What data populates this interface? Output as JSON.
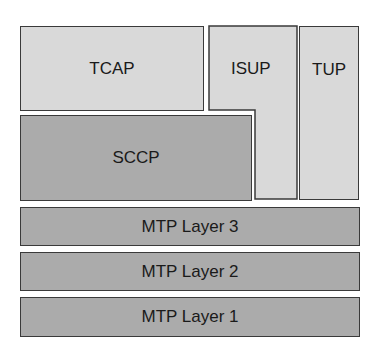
{
  "diagram": {
    "colors": {
      "upper_layer": "#d9d9d9",
      "lower_layer": "#ababab",
      "border": "#3a3a3a"
    },
    "blocks": {
      "tcap": "TCAP",
      "isup": "ISUP",
      "tup": "TUP",
      "sccp": "SCCP",
      "mtp3": "MTP Layer 3",
      "mtp2": "MTP Layer 2",
      "mtp1": "MTP Layer 1"
    }
  }
}
